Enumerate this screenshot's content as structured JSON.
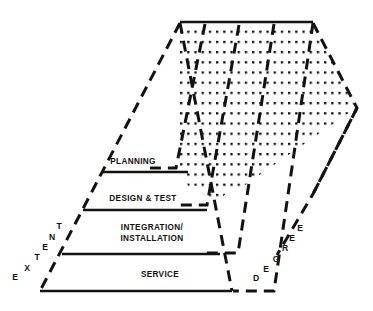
{
  "figure": {
    "type": "isometric-layered-pyramid-diagram",
    "background_color": "#ffffff",
    "stroke_color": "#121212",
    "dot_color": "#121212",
    "title": ""
  },
  "front_face": {
    "name": "front-triangular-face",
    "apex": {
      "x": 180,
      "y": 23
    },
    "base_left": {
      "x": 40,
      "y": 291
    },
    "base_right": {
      "x": 232,
      "y": 291
    },
    "tiers": [
      {
        "id": "planning",
        "label": "PLANNING",
        "order": 1,
        "label_x": 133,
        "label_y": 161,
        "divider_y": 172,
        "divider_x1": 103,
        "divider_x2": 188
      },
      {
        "id": "design-test",
        "label": "DESIGN & TEST",
        "order": 2,
        "label_x": 143,
        "label_y": 198,
        "divider_y": 210,
        "divider_x1": 83,
        "divider_x2": 207
      },
      {
        "id": "integration-installation",
        "label_line1": "INTEGRATION/",
        "label_line2": "INSTALLATION",
        "order": 3,
        "label_x": 152,
        "label_y": 232,
        "divider_y": 254,
        "divider_x1": 62,
        "divider_x2": 220
      },
      {
        "id": "service",
        "label": "SERVICE",
        "order": 4,
        "label_x": 160,
        "label_y": 274,
        "divider_y": 291,
        "divider_x1": 40,
        "divider_x2": 232
      }
    ]
  },
  "axes": {
    "left_axis": {
      "name": "extent-axis",
      "word": "EXTENT",
      "direction": "bottom-left to upper-right",
      "letters": [
        {
          "char": "E",
          "x": 15,
          "y": 277
        },
        {
          "char": "X",
          "x": 27,
          "y": 268
        },
        {
          "char": "T",
          "x": 37,
          "y": 257
        },
        {
          "char": "E",
          "x": 44,
          "y": 247
        },
        {
          "char": "N",
          "x": 51,
          "y": 237
        },
        {
          "char": "T",
          "x": 58,
          "y": 227
        }
      ]
    },
    "right_axis": {
      "name": "degree-axis",
      "word": "DEGREE",
      "direction": "bottom-left to upper-right",
      "letters": [
        {
          "char": "D",
          "x": 256,
          "y": 278
        },
        {
          "char": "E",
          "x": 266,
          "y": 270
        },
        {
          "char": "G",
          "x": 276,
          "y": 259
        },
        {
          "char": "R",
          "x": 284,
          "y": 248
        },
        {
          "char": "E",
          "x": 291,
          "y": 238
        },
        {
          "char": "E",
          "x": 299,
          "y": 228
        }
      ]
    }
  },
  "top_face": {
    "name": "dotted-top-face",
    "fill_pattern": "dot-grid",
    "dot_rows": 16,
    "solid_top_edge": {
      "x1": 180,
      "y1": 22,
      "x2": 313,
      "y2": 22
    },
    "far_corner": {
      "x": 357,
      "y": 108
    },
    "note": "receding isometric top surface rendered as rows of dots"
  },
  "nested_ridges": {
    "name": "nested-v-ridges",
    "count": 4,
    "style": "dashed",
    "description": "successive dashed V-shaped ridge lines receding to the right"
  }
}
